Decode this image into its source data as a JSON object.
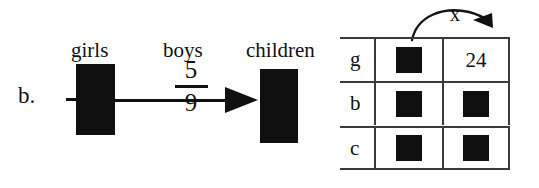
{
  "problem": {
    "letter": "b."
  },
  "tape_diagram": {
    "labels": {
      "source": "girls",
      "ratio_label": "boys",
      "target": "children"
    },
    "fraction": {
      "numerator": "5",
      "denominator": "9"
    },
    "bars": [
      {
        "name": "girls-bar",
        "fill": "#101010"
      },
      {
        "name": "children-bar",
        "fill": "#101010"
      }
    ],
    "arrow": {
      "direction": "right",
      "from": "girls",
      "to": "children"
    }
  },
  "grid": {
    "row_labels": [
      "g",
      "b",
      "c"
    ],
    "rows": [
      {
        "label": "g",
        "col1": "",
        "col2": "24"
      },
      {
        "label": "b",
        "col1": "",
        "col2": ""
      },
      {
        "label": "c",
        "col1": "",
        "col2": ""
      }
    ],
    "multiplier": {
      "label": "x",
      "arrow": "curved-arrow-right"
    },
    "border_color": "#3a3a3a",
    "block_color": "#101010"
  }
}
